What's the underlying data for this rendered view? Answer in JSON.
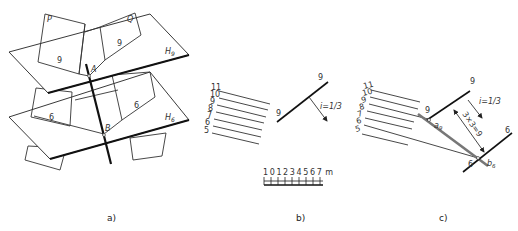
{
  "panels": {
    "a": {
      "caption": "a)",
      "plane_labels": {
        "p": "P",
        "q": "Q",
        "h9": "H9",
        "h6": "H6"
      },
      "point_labels": {
        "a": "A",
        "b": "B"
      },
      "contour_labels": {
        "p9": "9",
        "q9": "9",
        "p6": "6",
        "q6": "6"
      }
    },
    "b": {
      "caption": "b)",
      "contour_levels": [
        "11",
        "10",
        "9",
        "8",
        "7",
        "6",
        "5"
      ],
      "slope_line_labels": {
        "start": "9",
        "end": "9"
      },
      "gradient_label": "i=1/3",
      "scale_bar": {
        "ticks": [
          "1",
          "0",
          "1",
          "2",
          "3",
          "4",
          "5",
          "6",
          "7"
        ],
        "unit": "m"
      }
    },
    "c": {
      "caption": "c)",
      "contour_levels": [
        "11",
        "10",
        "9",
        "8",
        "7",
        "6",
        "5"
      ],
      "line9_labels": {
        "left": "9",
        "top": "9"
      },
      "line6_labels": {
        "left": "6",
        "right": "6"
      },
      "gradient_label": "i=1/3",
      "distance_label": "3×3=9",
      "point_labels": {
        "a9": "a9",
        "b6": "b6"
      }
    }
  }
}
